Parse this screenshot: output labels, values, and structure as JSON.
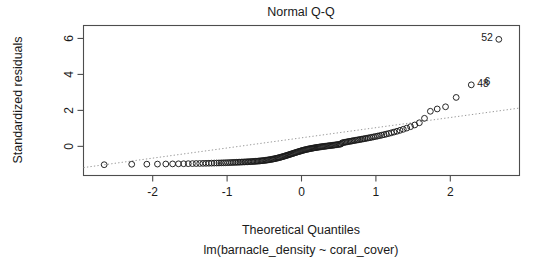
{
  "chart_data": {
    "type": "scatter",
    "title": "Normal Q-Q",
    "xlabel": "Theoretical Quantiles",
    "ylabel": "Standardized residuals",
    "subtitle": "lm(barnacle_density ~ coral_cover)",
    "xlim": [
      -2.93,
      2.93
    ],
    "ylim": [
      -1.62,
      6.72
    ],
    "xticks": [
      -2,
      -1,
      0,
      1,
      2
    ],
    "xtick_labels": [
      "-2",
      "-1",
      "0",
      "1",
      "2"
    ],
    "yticks": [
      0,
      2,
      4,
      6
    ],
    "ytick_labels": [
      "0",
      "2",
      "4",
      "6"
    ],
    "grid": false,
    "legend": "none",
    "series": [
      {
        "name": "standardized residuals",
        "marker": "open-circle",
        "x": [
          -2.652,
          -2.282,
          -2.079,
          -1.936,
          -1.824,
          -1.732,
          -1.653,
          -1.584,
          -1.522,
          -1.466,
          -1.415,
          -1.368,
          -1.324,
          -1.283,
          -1.244,
          -1.208,
          -1.173,
          -1.14,
          -1.109,
          -1.079,
          -1.05,
          -1.022,
          -0.995,
          -0.969,
          -0.944,
          -0.92,
          -0.896,
          -0.873,
          -0.851,
          -0.829,
          -0.808,
          -0.787,
          -0.766,
          -0.746,
          -0.727,
          -0.707,
          -0.688,
          -0.67,
          -0.651,
          -0.633,
          -0.616,
          -0.598,
          -0.581,
          -0.564,
          -0.547,
          -0.53,
          -0.514,
          -0.497,
          -0.481,
          -0.465,
          -0.449,
          -0.434,
          -0.418,
          -0.403,
          -0.387,
          -0.372,
          -0.357,
          -0.342,
          -0.327,
          -0.312,
          -0.297,
          -0.283,
          -0.268,
          -0.253,
          -0.239,
          -0.224,
          -0.21,
          -0.196,
          -0.181,
          -0.167,
          -0.153,
          -0.139,
          -0.124,
          -0.11,
          -0.096,
          -0.082,
          -0.068,
          -0.054,
          -0.04,
          -0.026,
          -0.013,
          0.0,
          0.013,
          0.026,
          0.04,
          0.054,
          0.068,
          0.082,
          0.096,
          0.11,
          0.124,
          0.139,
          0.153,
          0.167,
          0.181,
          0.196,
          0.21,
          0.224,
          0.239,
          0.253,
          0.268,
          0.283,
          0.297,
          0.312,
          0.327,
          0.342,
          0.357,
          0.372,
          0.387,
          0.403,
          0.418,
          0.434,
          0.449,
          0.465,
          0.481,
          0.497,
          0.514,
          0.53,
          0.547,
          0.564,
          0.581,
          0.598,
          0.616,
          0.633,
          0.651,
          0.67,
          0.688,
          0.707,
          0.727,
          0.746,
          0.766,
          0.787,
          0.808,
          0.829,
          0.851,
          0.873,
          0.896,
          0.92,
          0.944,
          0.969,
          0.995,
          1.022,
          1.05,
          1.079,
          1.109,
          1.14,
          1.173,
          1.208,
          1.244,
          1.283,
          1.324,
          1.368,
          1.415,
          1.466,
          1.522,
          1.584,
          1.653,
          1.732,
          1.824,
          1.936,
          2.079,
          2.282,
          2.652
        ],
        "y": [
          -1.02,
          -0.995,
          -0.99,
          -0.985,
          -0.98,
          -0.975,
          -0.97,
          -0.966,
          -0.962,
          -0.958,
          -0.954,
          -0.95,
          -0.946,
          -0.942,
          -0.938,
          -0.934,
          -0.93,
          -0.926,
          -0.922,
          -0.918,
          -0.914,
          -0.91,
          -0.906,
          -0.902,
          -0.898,
          -0.894,
          -0.89,
          -0.886,
          -0.882,
          -0.878,
          -0.874,
          -0.87,
          -0.866,
          -0.862,
          -0.858,
          -0.854,
          -0.85,
          -0.845,
          -0.84,
          -0.835,
          -0.83,
          -0.824,
          -0.818,
          -0.812,
          -0.805,
          -0.798,
          -0.79,
          -0.782,
          -0.773,
          -0.764,
          -0.754,
          -0.744,
          -0.733,
          -0.721,
          -0.709,
          -0.696,
          -0.683,
          -0.669,
          -0.654,
          -0.639,
          -0.623,
          -0.607,
          -0.59,
          -0.573,
          -0.555,
          -0.537,
          -0.519,
          -0.5,
          -0.481,
          -0.462,
          -0.443,
          -0.424,
          -0.405,
          -0.386,
          -0.367,
          -0.348,
          -0.33,
          -0.312,
          -0.294,
          -0.277,
          -0.26,
          -0.244,
          -0.228,
          -0.213,
          -0.198,
          -0.184,
          -0.17,
          -0.157,
          -0.144,
          -0.132,
          -0.12,
          -0.109,
          -0.098,
          -0.087,
          -0.077,
          -0.067,
          -0.057,
          -0.048,
          -0.039,
          -0.03,
          -0.021,
          -0.013,
          -0.005,
          0.003,
          0.011,
          0.019,
          0.027,
          0.035,
          0.043,
          0.051,
          0.059,
          0.068,
          0.077,
          0.086,
          0.096,
          0.106,
          0.117,
          0.129,
          0.196,
          0.211,
          0.225,
          0.239,
          0.253,
          0.267,
          0.281,
          0.295,
          0.309,
          0.323,
          0.337,
          0.352,
          0.367,
          0.382,
          0.398,
          0.414,
          0.431,
          0.448,
          0.466,
          0.485,
          0.505,
          0.526,
          0.548,
          0.571,
          0.596,
          0.623,
          0.652,
          0.683,
          0.717,
          0.754,
          0.795,
          0.84,
          0.891,
          0.949,
          1.016,
          1.095,
          1.19,
          1.312,
          1.56,
          1.95,
          2.08,
          2.2,
          2.72,
          3.42,
          5.95
        ]
      }
    ],
    "reference_line": {
      "style": "dotted",
      "color": "#999999",
      "x": [
        -2.93,
        2.93
      ],
      "y": [
        -1.18,
        2.13
      ]
    },
    "point_labels": [
      {
        "text": "52",
        "x": 2.652,
        "y": 5.95,
        "side": "left"
      },
      {
        "text": "48",
        "x": 2.282,
        "y": 3.42,
        "side": "right"
      },
      {
        "text": "6",
        "x": 2.38,
        "y": 3.52,
        "side": "right"
      }
    ]
  }
}
